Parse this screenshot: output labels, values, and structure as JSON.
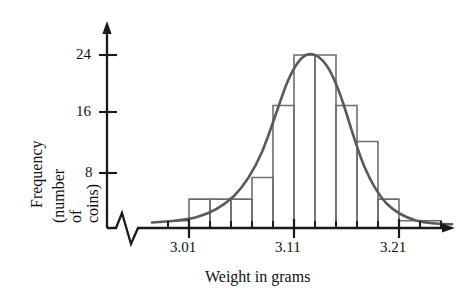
{
  "figure": {
    "kind": "statistics-textbook-histogram",
    "background_color": "#ffffff",
    "axis_color": "#1a1a1a",
    "bar_outline_color": "#6e6e6e",
    "curve_color": "#5a5a5a"
  },
  "axes": {
    "y_title_line1": "Frequency",
    "y_title_line2": "(number of coins)",
    "x_title": "Weight in grams",
    "y_ticks": [
      "8",
      "16",
      "24"
    ],
    "x_ticks": [
      "3.01",
      "3.11",
      "3.21"
    ],
    "has_axis_break": true,
    "axis_break_symbol": "zigzag"
  },
  "chart_data": {
    "type": "bar",
    "title": "",
    "subtitle": "",
    "xlabel": "Weight in grams",
    "ylabel": "Frequency (number of coins)",
    "xlim": [
      2.975,
      3.255
    ],
    "ylim": [
      0,
      26
    ],
    "xtick_labels": [
      "3.01",
      "3.11",
      "3.21"
    ],
    "xtick_values": [
      3.01,
      3.11,
      3.21
    ],
    "ytick_labels": [
      "8",
      "16",
      "24"
    ],
    "ytick_values": [
      8,
      16,
      24
    ],
    "minor_xtick_step": 0.02,
    "grid": false,
    "legend": null,
    "bin_width": 0.02,
    "bin_left_edges": [
      2.99,
      3.01,
      3.03,
      3.05,
      3.07,
      3.09,
      3.11,
      3.13,
      3.15,
      3.17,
      3.19,
      3.21,
      3.23
    ],
    "categories": [
      "2.99-3.01",
      "3.01-3.03",
      "3.03-3.05",
      "3.05-3.07",
      "3.07-3.09",
      "3.09-3.11",
      "3.11-3.13",
      "3.13-3.15",
      "3.15-3.17",
      "3.17-3.19",
      "3.19-3.21",
      "3.21-3.23",
      "3.23-3.25"
    ],
    "values": [
      1,
      4,
      4,
      4,
      7,
      17,
      24,
      24,
      17,
      12,
      4,
      1,
      1
    ],
    "annotations": [
      "smooth normal curve overlaid on the histogram",
      "horizontal axis has a break mark near the origin"
    ],
    "overlay_curve": {
      "type": "line",
      "name": "normal curve",
      "mean": 3.115,
      "peak_value": 24
    }
  }
}
